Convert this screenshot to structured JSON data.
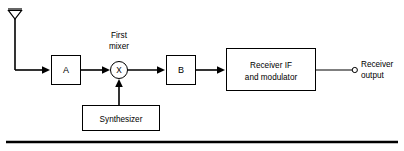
{
  "figure": {
    "background_color": "#ffffff",
    "line_color": "#000000"
  },
  "antenna": {
    "name": "antenna",
    "symbol": "dipole-antenna-icon"
  },
  "blocks": [
    {
      "id": "a",
      "label": "A",
      "name": "block-a"
    },
    {
      "id": "mixer",
      "label": "X",
      "name": "first-mixer",
      "annotation_line1": "First",
      "annotation_line2": "mixer"
    },
    {
      "id": "b",
      "label": "B",
      "name": "block-b"
    },
    {
      "id": "if",
      "label_line1": "Receiver IF",
      "label_line2": "and modulator",
      "name": "receiver-if-block"
    },
    {
      "id": "synth",
      "label": "Synthesizer",
      "name": "synthesizer-block"
    }
  ],
  "labels": {
    "block_a": "A",
    "block_b": "B",
    "mixer_symbol": "X",
    "mixer_caption_1": "First",
    "mixer_caption_2": "mixer",
    "if_line_1": "Receiver IF",
    "if_line_2": "and modulator",
    "synthesizer": "Synthesizer",
    "output_line_1": "Receiver",
    "output_line_2": "output"
  },
  "terminal": {
    "name": "receiver-output-terminal",
    "label_line1": "Receiver",
    "label_line2": "output"
  },
  "rule": {
    "name": "bottom-rule"
  }
}
